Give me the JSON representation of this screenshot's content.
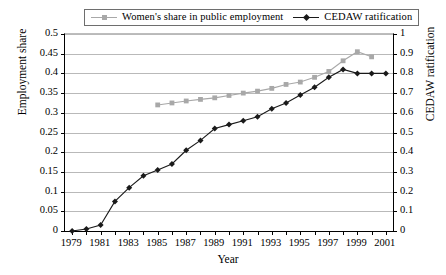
{
  "chart_data": {
    "type": "line",
    "title": "",
    "xlabel": "Year",
    "ylabel": "Employment share",
    "y2label": "CEDAW ratification",
    "x": [
      1979,
      1980,
      1981,
      1982,
      1983,
      1984,
      1985,
      1986,
      1987,
      1988,
      1989,
      1990,
      1991,
      1992,
      1993,
      1994,
      1995,
      1996,
      1997,
      1998,
      1999,
      2000,
      2001
    ],
    "xlim": [
      1978.5,
      2001.5
    ],
    "xtick_labels": [
      "1979",
      "1981",
      "1983",
      "1985",
      "1987",
      "1989",
      "1991",
      "1993",
      "1995",
      "1997",
      "1999",
      "2001"
    ],
    "xtick_values": [
      1979,
      1981,
      1983,
      1985,
      1987,
      1989,
      1991,
      1993,
      1995,
      1997,
      1999,
      2001
    ],
    "ylim": [
      0,
      0.5
    ],
    "ytick_labels": [
      "0",
      "0.05",
      "0.1",
      "0.15",
      "0.2",
      "0.25",
      "0.3",
      "0.35",
      "0.4",
      "0.45",
      "0.5"
    ],
    "ytick_values": [
      0,
      0.05,
      0.1,
      0.15,
      0.2,
      0.25,
      0.3,
      0.35,
      0.4,
      0.45,
      0.5
    ],
    "y2lim": [
      0,
      1
    ],
    "y2tick_labels": [
      "0",
      "0.1",
      "0.2",
      "0.3",
      "0.4",
      "0.5",
      "0.6",
      "0.7",
      "0.8",
      "0.9",
      "1"
    ],
    "y2tick_values": [
      0,
      0.1,
      0.2,
      0.3,
      0.4,
      0.5,
      0.6,
      0.7,
      0.8,
      0.9,
      1
    ],
    "grid": true,
    "legend_position": "top-center",
    "series": [
      {
        "name": "Women's share in public employment",
        "axis": "left",
        "color": "#a8a8a8",
        "marker": "square",
        "x": [
          1985,
          1986,
          1987,
          1988,
          1989,
          1990,
          1991,
          1992,
          1993,
          1994,
          1995,
          1996,
          1997,
          1998,
          1999,
          2000
        ],
        "values": [
          0.32,
          0.325,
          0.33,
          0.334,
          0.338,
          0.344,
          0.35,
          0.355,
          0.362,
          0.372,
          0.378,
          0.39,
          0.405,
          0.432,
          0.455,
          0.442
        ]
      },
      {
        "name": "CEDAW ratification",
        "axis": "right",
        "color": "#1a1a1a",
        "marker": "diamond",
        "x": [
          1979,
          1980,
          1981,
          1982,
          1983,
          1984,
          1985,
          1986,
          1987,
          1988,
          1989,
          1990,
          1991,
          1992,
          1993,
          1994,
          1995,
          1996,
          1997,
          1998,
          1999,
          2000,
          2001
        ],
        "values": [
          0.0,
          0.01,
          0.03,
          0.15,
          0.22,
          0.28,
          0.31,
          0.34,
          0.41,
          0.46,
          0.52,
          0.54,
          0.56,
          0.58,
          0.62,
          0.65,
          0.69,
          0.73,
          0.78,
          0.82,
          0.8,
          0.8,
          0.8
        ]
      }
    ]
  },
  "legend": {
    "items": [
      {
        "label": "Women's share in public employment",
        "color": "#a8a8a8",
        "marker": "square"
      },
      {
        "label": "CEDAW ratification",
        "color": "#1a1a1a",
        "marker": "diamond"
      }
    ]
  },
  "axes": {
    "y_left_title": "Employment share",
    "y_right_title": "CEDAW ratification",
    "x_title": "Year"
  }
}
